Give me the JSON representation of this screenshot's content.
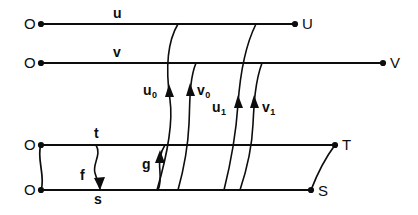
{
  "figure": {
    "type": "commutative-diagram",
    "background_color": "#ffffff",
    "ink_color": "#0d0d0d",
    "width": 418,
    "height": 215
  },
  "endpoints": {
    "origin_u": "O",
    "origin_v": "O",
    "origin_t": "O",
    "origin_s": "O",
    "terminal_u": "U",
    "terminal_v": "V",
    "terminal_t": "T",
    "terminal_s": "S"
  },
  "edge_labels": {
    "u": "u",
    "v": "v",
    "t": "t",
    "s": "s"
  },
  "morphism_labels": {
    "u_zero": "u",
    "u_zero_sub": "0",
    "v_zero": "v",
    "v_zero_sub": "0",
    "u_one": "u",
    "u_one_sub": "1",
    "v_one": "v",
    "v_one_sub": "1",
    "f": "f",
    "g": "g"
  },
  "lines": [
    {
      "name": "u-line",
      "label": "u",
      "start": "O",
      "end": "U",
      "y": 24,
      "x1": 41,
      "x2": 295
    },
    {
      "name": "v-line",
      "label": "v",
      "start": "O",
      "end": "V",
      "y": 63,
      "x1": 41,
      "x2": 383
    },
    {
      "name": "t-line",
      "label": "t",
      "start": "O",
      "end": "T",
      "y": 145,
      "x1": 41,
      "x2": 335
    },
    {
      "name": "s-line",
      "label": "s",
      "start": "O",
      "end": "S",
      "y": 190,
      "x1": 41,
      "x2": 311
    }
  ],
  "arrows": [
    {
      "name": "u0",
      "label": "u0",
      "from_line": "s-line",
      "to_line": "u-line",
      "direction": "up"
    },
    {
      "name": "v0",
      "label": "v0",
      "from_line": "s-line",
      "to_line": "v-line",
      "direction": "up"
    },
    {
      "name": "u1",
      "label": "u1",
      "from_line": "s-line",
      "to_line": "u-line",
      "direction": "up"
    },
    {
      "name": "v1",
      "label": "v1",
      "from_line": "s-line",
      "to_line": "v-line",
      "direction": "up"
    },
    {
      "name": "f",
      "label": "f",
      "from_line": "t-line",
      "to_line": "s-line",
      "direction": "down"
    },
    {
      "name": "g",
      "label": "g",
      "from_line": "s-line",
      "to_line": "t-line",
      "direction": "up"
    }
  ]
}
